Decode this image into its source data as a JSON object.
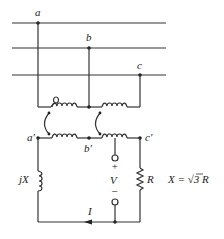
{
  "diagram": {
    "type": "circuit",
    "bus_labels": {
      "a": "a",
      "b": "b",
      "c": "c"
    },
    "secondary_labels": {
      "a_prime": "a′",
      "b_prime": "b′",
      "c_prime": "c′"
    },
    "components": {
      "inductor_label": "jX",
      "resistor_label": "R",
      "voltage_label": "V",
      "voltage_plus": "+",
      "voltage_minus": "−",
      "current_label": "I"
    },
    "equation": {
      "lhs": "X = ",
      "sqrt": "√3",
      "rhs": " R"
    },
    "colors": {
      "line": "#333333",
      "background": "#ffffff"
    }
  }
}
